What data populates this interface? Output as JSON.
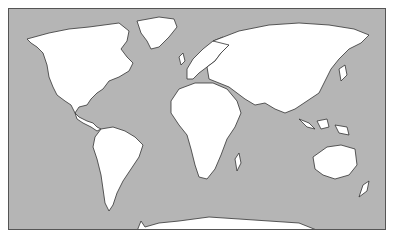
{
  "map": {
    "title": "",
    "type": "world-outline",
    "colors": {
      "ocean": "#b5b5b5",
      "land": "#ffffff",
      "outline": "#333333",
      "frame": "#555555"
    },
    "regions": [
      "North America",
      "Greenland",
      "South America",
      "Europe",
      "Africa",
      "Asia",
      "Australia",
      "Antarctica",
      "Madagascar",
      "New Zealand",
      "Japan",
      "Indonesia",
      "United Kingdom"
    ]
  }
}
